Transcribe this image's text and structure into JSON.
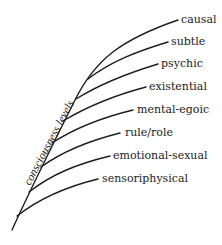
{
  "diagram": {
    "axis_label": "consciousness levels",
    "levels": [
      {
        "label": "causal",
        "x": 181,
        "y": 23
      },
      {
        "label": "subtle",
        "x": 171,
        "y": 45
      },
      {
        "label": "psychic",
        "x": 161,
        "y": 67
      },
      {
        "label": "existential",
        "x": 149,
        "y": 90
      },
      {
        "label": "mental-egoic",
        "x": 137,
        "y": 113
      },
      {
        "label": "rule/role",
        "x": 125,
        "y": 136
      },
      {
        "label": "emotional-sexual",
        "x": 113,
        "y": 159
      },
      {
        "label": "sensoriphysical",
        "x": 102,
        "y": 182
      }
    ],
    "line_color": "#1e1e1e",
    "text_color": "#222222"
  }
}
